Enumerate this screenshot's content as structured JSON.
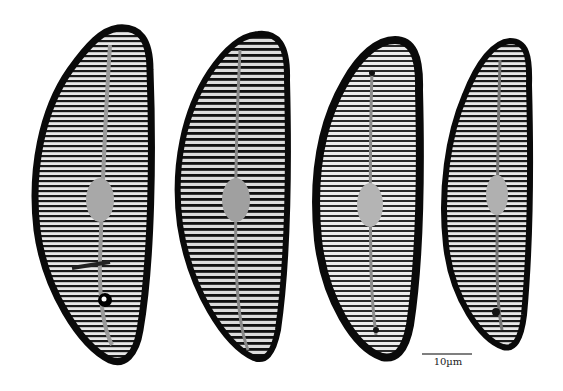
{
  "image": {
    "description": "Light micrographs of four Cymbella-like diatom valves, dorsiventral, with radiate striae and a central raphe",
    "background": "#ffffff",
    "specimens": [
      {
        "label": "valve-1"
      },
      {
        "label": "valve-2"
      },
      {
        "label": "valve-3"
      },
      {
        "label": "valve-4"
      }
    ],
    "scale_bar": {
      "label": "10µm",
      "color": "#555555"
    }
  }
}
